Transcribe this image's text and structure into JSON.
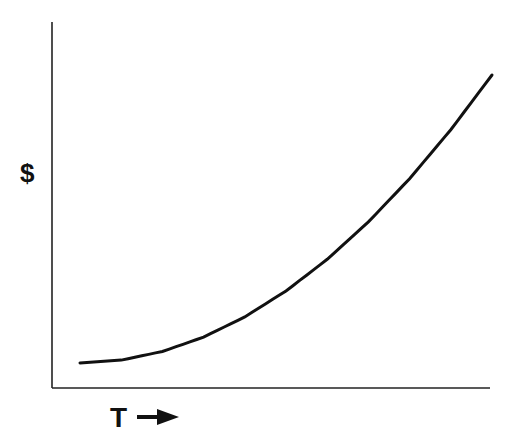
{
  "chart_data": {
    "type": "line",
    "title": "",
    "xlabel": "T",
    "xlabel_arrow": "→",
    "ylabel": "$",
    "grid": false,
    "legend": null,
    "x": [
      0,
      1,
      2,
      3,
      4,
      5,
      6,
      7,
      8,
      9,
      10
    ],
    "series": [
      {
        "name": "cost over time",
        "values": [
          0.0,
          0.01,
          0.04,
          0.09,
          0.16,
          0.25,
          0.36,
          0.49,
          0.64,
          0.81,
          1.0
        ],
        "color": "#111111"
      }
    ],
    "xlim": [
      0,
      10
    ],
    "ylim": [
      0,
      1
    ]
  },
  "axes": {
    "y_label": "$",
    "x_label": "T",
    "x_arrow": "→"
  },
  "colors": {
    "line": "#111111",
    "axis": "#222222",
    "background": "#ffffff"
  }
}
